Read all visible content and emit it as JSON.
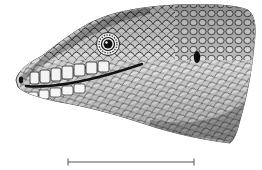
{
  "figure": {
    "style": "stippled black-and-white scientific drawing",
    "colors": {
      "background": "#ffffff",
      "ink": "#1a1a1a",
      "mid_tone": "#8a8a8a",
      "light_tone": "#d9d9d9"
    },
    "features": [
      "snout with nostril",
      "eye with concentric ring",
      "mouth line",
      "ear opening",
      "overlapping cycloid scales"
    ],
    "scale_bar": {
      "present": true,
      "label": ""
    }
  }
}
